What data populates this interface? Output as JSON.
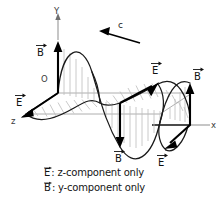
{
  "figure": {
    "kind": "electromagnetic-wave-diagram",
    "background_color": "#ffffff",
    "ink_color": "#111111",
    "hatch_color": "#bdbdbd",
    "axis_color": "#8d8d8d"
  },
  "axes": {
    "y": {
      "label": "Y",
      "direction": "up"
    },
    "x": {
      "label": "x",
      "direction": "right"
    },
    "z": {
      "label": "z",
      "direction": "down-left"
    },
    "origin": {
      "label": "O"
    }
  },
  "propagation": {
    "symbol": "c",
    "direction": "left",
    "description": "wave travels in the negative x direction"
  },
  "vectors": [
    {
      "id": "b-origin-up",
      "symbol": "B",
      "label": "B",
      "orientation": "up",
      "position": "first crest at origin"
    },
    {
      "id": "e-origin-z",
      "symbol": "E",
      "label": "E",
      "orientation": "down-left",
      "position": "first trough along z"
    },
    {
      "id": "b-mid-down",
      "symbol": "B",
      "label": "B",
      "orientation": "down",
      "position": "middle trough"
    },
    {
      "id": "e-mid-up",
      "symbol": "E",
      "label": "E",
      "orientation": "up-right",
      "position": "middle crest along z"
    },
    {
      "id": "b-right-up",
      "symbol": "B",
      "label": "B",
      "orientation": "up",
      "position": "right crest"
    },
    {
      "id": "e-right-down",
      "symbol": "E",
      "label": "E",
      "orientation": "down-left",
      "position": "right trough along z"
    }
  ],
  "caption": {
    "lines": [
      {
        "symbol": "E",
        "text": ": z-component only"
      },
      {
        "symbol": "B",
        "text": ": y-component only"
      }
    ]
  }
}
